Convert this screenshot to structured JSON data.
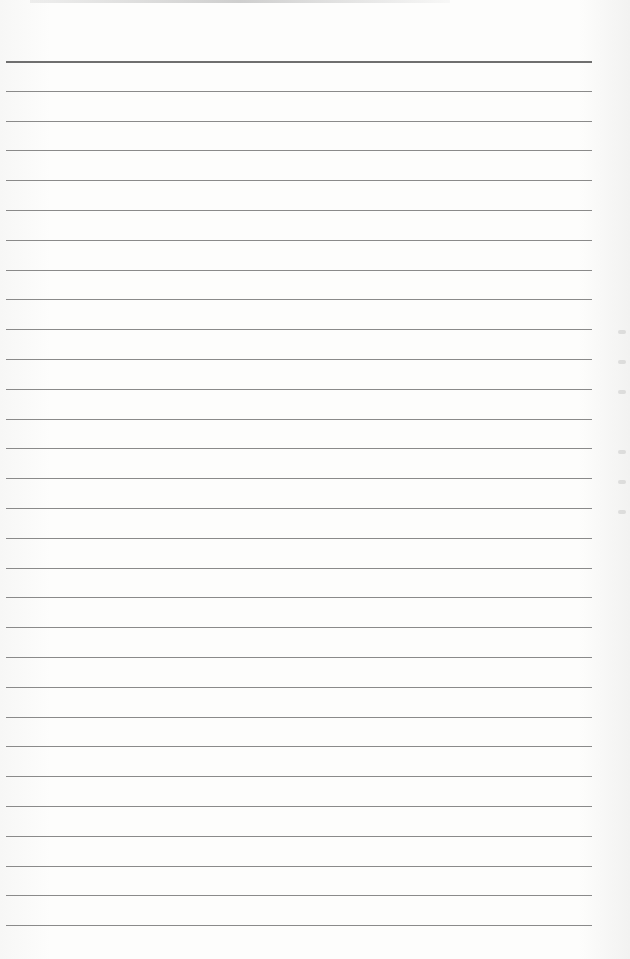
{
  "document": {
    "type": "lined-paper",
    "rule_count": 30,
    "first_rule_y": 61,
    "rule_spacing": 29.8,
    "rule_left": 6,
    "rule_width": 586,
    "rule_color": "#8a8a8a",
    "first_rule_color": "#6f6f6f",
    "background": "#fdfdfc",
    "text": ""
  }
}
